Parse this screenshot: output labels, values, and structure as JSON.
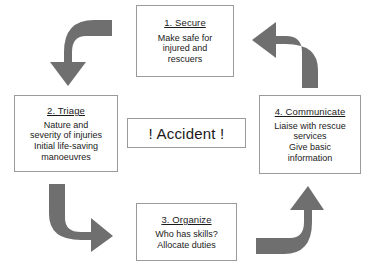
{
  "diagram": {
    "center": {
      "label": "! Accident !"
    },
    "colors": {
      "arrow_fill": "#6f6f6f",
      "box_border": "#9a9a9a",
      "text": "#1a1a1a",
      "background": "#ffffff"
    },
    "steps": [
      {
        "id": "secure",
        "heading": "1. Secure",
        "lines": [
          "Make safe for",
          "injured and",
          "rescuers"
        ]
      },
      {
        "id": "triage",
        "heading": "2. Triage",
        "lines": [
          "Nature and",
          "severity of injuries",
          "Initial life-saving",
          "manoeuvres"
        ]
      },
      {
        "id": "organize",
        "heading": "3. Organize",
        "lines": [
          "Who has skills?",
          "Allocate duties"
        ]
      },
      {
        "id": "communicate",
        "heading": "4. Communicate",
        "lines": [
          "Liaise with rescue",
          "services",
          "Give basic",
          "information"
        ]
      }
    ],
    "arrows": [
      {
        "id": "secure-to-triage",
        "icon": "curved-arrow-down-left",
        "direction": "down"
      },
      {
        "id": "triage-to-organize",
        "icon": "curved-arrow-right-down",
        "direction": "right"
      },
      {
        "id": "organize-to-communicate",
        "icon": "curved-arrow-up-right",
        "direction": "up"
      },
      {
        "id": "communicate-to-secure",
        "icon": "curved-arrow-left-up",
        "direction": "left"
      }
    ],
    "caption": ""
  }
}
